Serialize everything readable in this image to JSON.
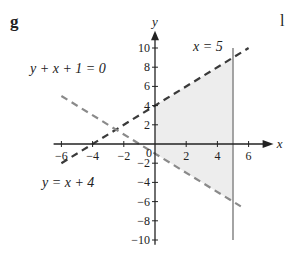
{
  "part_label": "g",
  "next_part_label": "l",
  "chart_data": {
    "type": "line",
    "title": "",
    "xlabel": "x",
    "ylabel": "y",
    "xlim": [
      -6.5,
      7
    ],
    "ylim": [
      -10.5,
      11
    ],
    "x_ticks": [
      -6,
      -4,
      -2,
      0,
      2,
      4,
      6
    ],
    "y_ticks": [
      -10,
      -8,
      -6,
      -4,
      -2,
      2,
      4,
      6,
      8,
      10
    ],
    "origin_label": "0",
    "grid": false,
    "series": [
      {
        "name": "y = x + 4",
        "style": "dashed",
        "color": "#3a3a3a",
        "x": [
          -6,
          6
        ],
        "y": [
          -2,
          10
        ]
      },
      {
        "name": "y + x + 1 = 0",
        "style": "dashed",
        "color": "#8a8a8a",
        "x": [
          -6,
          5.5
        ],
        "y": [
          5,
          -6.5
        ]
      },
      {
        "name": "x = 5",
        "style": "solid",
        "color": "#9a9a9a",
        "x": [
          5,
          5
        ],
        "y": [
          -10,
          10
        ]
      }
    ],
    "shaded_region": {
      "description": "region bounded by x=0, x=5, y=x+4 and y+x+1=0",
      "vertices": [
        [
          0,
          4
        ],
        [
          5,
          9
        ],
        [
          5,
          -6
        ],
        [
          0,
          -1
        ]
      ],
      "color": "#ededed"
    },
    "annotations": [
      {
        "text": "x = 5",
        "at": [
          3.7,
          10
        ]
      },
      {
        "text": "y + x + 1 = 0",
        "at": [
          -5.5,
          8
        ]
      },
      {
        "text": "y = x + 4",
        "at": [
          -5.5,
          -3.5
        ]
      }
    ]
  }
}
